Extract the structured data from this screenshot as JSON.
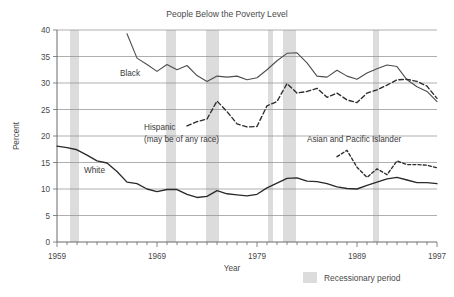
{
  "chart_data": {
    "type": "line",
    "title": "People Below the Poverty Level",
    "xlabel": "Year",
    "ylabel": "Percent",
    "xlim": [
      1959,
      1997
    ],
    "ylim": [
      0,
      40
    ],
    "ytick_step": 5,
    "yticks": [
      "0",
      "5",
      "10",
      "15",
      "20",
      "25",
      "30",
      "35",
      "40"
    ],
    "xticks_labeled": [
      "1959",
      "1969",
      "1979",
      "1989",
      "1997"
    ],
    "grid": "horizontal",
    "legend_position": "bottom-right",
    "series": [
      {
        "name": "White",
        "style": "solid",
        "x": [
          1959,
          1960,
          1961,
          1962,
          1963,
          1964,
          1965,
          1966,
          1967,
          1968,
          1969,
          1970,
          1971,
          1972,
          1973,
          1974,
          1975,
          1976,
          1977,
          1978,
          1979,
          1980,
          1981,
          1982,
          1983,
          1984,
          1985,
          1986,
          1987,
          1988,
          1989,
          1990,
          1991,
          1992,
          1993,
          1994,
          1995,
          1996,
          1997
        ],
        "values": [
          18.1,
          17.8,
          17.4,
          16.4,
          15.3,
          14.9,
          13.3,
          11.3,
          11.0,
          10.0,
          9.5,
          9.9,
          9.9,
          9.0,
          8.4,
          8.6,
          9.7,
          9.1,
          8.9,
          8.7,
          9.0,
          10.2,
          11.1,
          12.0,
          12.1,
          11.5,
          11.4,
          11.0,
          10.4,
          10.1,
          10.0,
          10.7,
          11.3,
          11.9,
          12.2,
          11.7,
          11.2,
          11.2,
          11.0
        ]
      },
      {
        "name": "Black",
        "style": "solid-thin",
        "x": [
          1966,
          1967,
          1968,
          1969,
          1970,
          1971,
          1972,
          1973,
          1974,
          1975,
          1976,
          1977,
          1978,
          1979,
          1980,
          1981,
          1982,
          1983,
          1984,
          1985,
          1986,
          1987,
          1988,
          1989,
          1990,
          1991,
          1992,
          1993,
          1994,
          1995,
          1996,
          1997
        ],
        "values": [
          39.3,
          34.7,
          33.5,
          32.2,
          33.5,
          32.5,
          33.3,
          31.4,
          30.3,
          31.3,
          31.1,
          31.3,
          30.6,
          31.0,
          32.5,
          34.2,
          35.6,
          35.7,
          33.8,
          31.3,
          31.1,
          32.4,
          31.3,
          30.7,
          31.9,
          32.7,
          33.4,
          33.1,
          30.6,
          29.3,
          28.4,
          26.5
        ]
      },
      {
        "name": "Hispanic (may be of any race)",
        "style": "dashed",
        "x": [
          1972,
          1973,
          1974,
          1975,
          1976,
          1977,
          1978,
          1979,
          1980,
          1981,
          1982,
          1983,
          1984,
          1985,
          1986,
          1987,
          1988,
          1989,
          1990,
          1991,
          1992,
          1993,
          1994,
          1995,
          1996,
          1997
        ],
        "values": [
          21.9,
          22.7,
          23.2,
          26.6,
          24.6,
          22.3,
          21.7,
          21.8,
          25.7,
          26.5,
          29.9,
          28.1,
          28.4,
          29.0,
          27.3,
          28.1,
          26.8,
          26.3,
          28.1,
          28.7,
          29.6,
          30.6,
          30.7,
          30.3,
          29.4,
          27.1
        ]
      },
      {
        "name": "Asian and Pacific Islander",
        "style": "dotted",
        "x": [
          1987,
          1988,
          1989,
          1990,
          1991,
          1992,
          1993,
          1994,
          1995,
          1996,
          1997
        ],
        "values": [
          16.1,
          17.3,
          14.1,
          12.2,
          13.8,
          12.7,
          15.3,
          14.6,
          14.6,
          14.5,
          14.0
        ]
      }
    ],
    "recessions": [
      {
        "start": 1960.3,
        "end": 1961.2
      },
      {
        "start": 1969.9,
        "end": 1970.9
      },
      {
        "start": 1973.9,
        "end": 1975.2
      },
      {
        "start": 1980.1,
        "end": 1980.6
      },
      {
        "start": 1981.6,
        "end": 1982.9
      },
      {
        "start": 1990.6,
        "end": 1991.2
      }
    ],
    "annotations": [
      {
        "name": "black-label",
        "text": "Black"
      },
      {
        "name": "hispanic-label-line1",
        "text": "Hispanic"
      },
      {
        "name": "hispanic-label-line2",
        "text": "(may be of any race)"
      },
      {
        "name": "white-label",
        "text": "White"
      },
      {
        "name": "asian-label",
        "text": "Asian and Pacific Islander"
      }
    ],
    "legend": [
      {
        "label": "Recessionary period",
        "color": "#dcdcdc"
      }
    ]
  }
}
